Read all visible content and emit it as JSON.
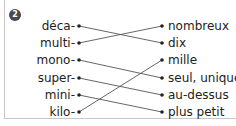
{
  "exercise": {
    "number": "2",
    "left_items": [
      "déca-",
      "multi-",
      "mono-",
      "super-",
      "mini-",
      "kilo-"
    ],
    "right_items": [
      "nombreux",
      "dix",
      "mille",
      "seul, unique",
      "au-dessus",
      "plus petit"
    ],
    "connections": [
      {
        "from": "déca-",
        "to": "dix"
      },
      {
        "from": "multi-",
        "to": "nombreux"
      },
      {
        "from": "mono-",
        "to": "seul, unique"
      },
      {
        "from": "super-",
        "to": "au-dessus"
      },
      {
        "from": "mini-",
        "to": "plus petit"
      },
      {
        "from": "kilo-",
        "to": "mille"
      }
    ],
    "colors": {
      "line": "#555555",
      "dot": "#222222",
      "badge": "#4a4a4a",
      "text": "#222222"
    }
  }
}
